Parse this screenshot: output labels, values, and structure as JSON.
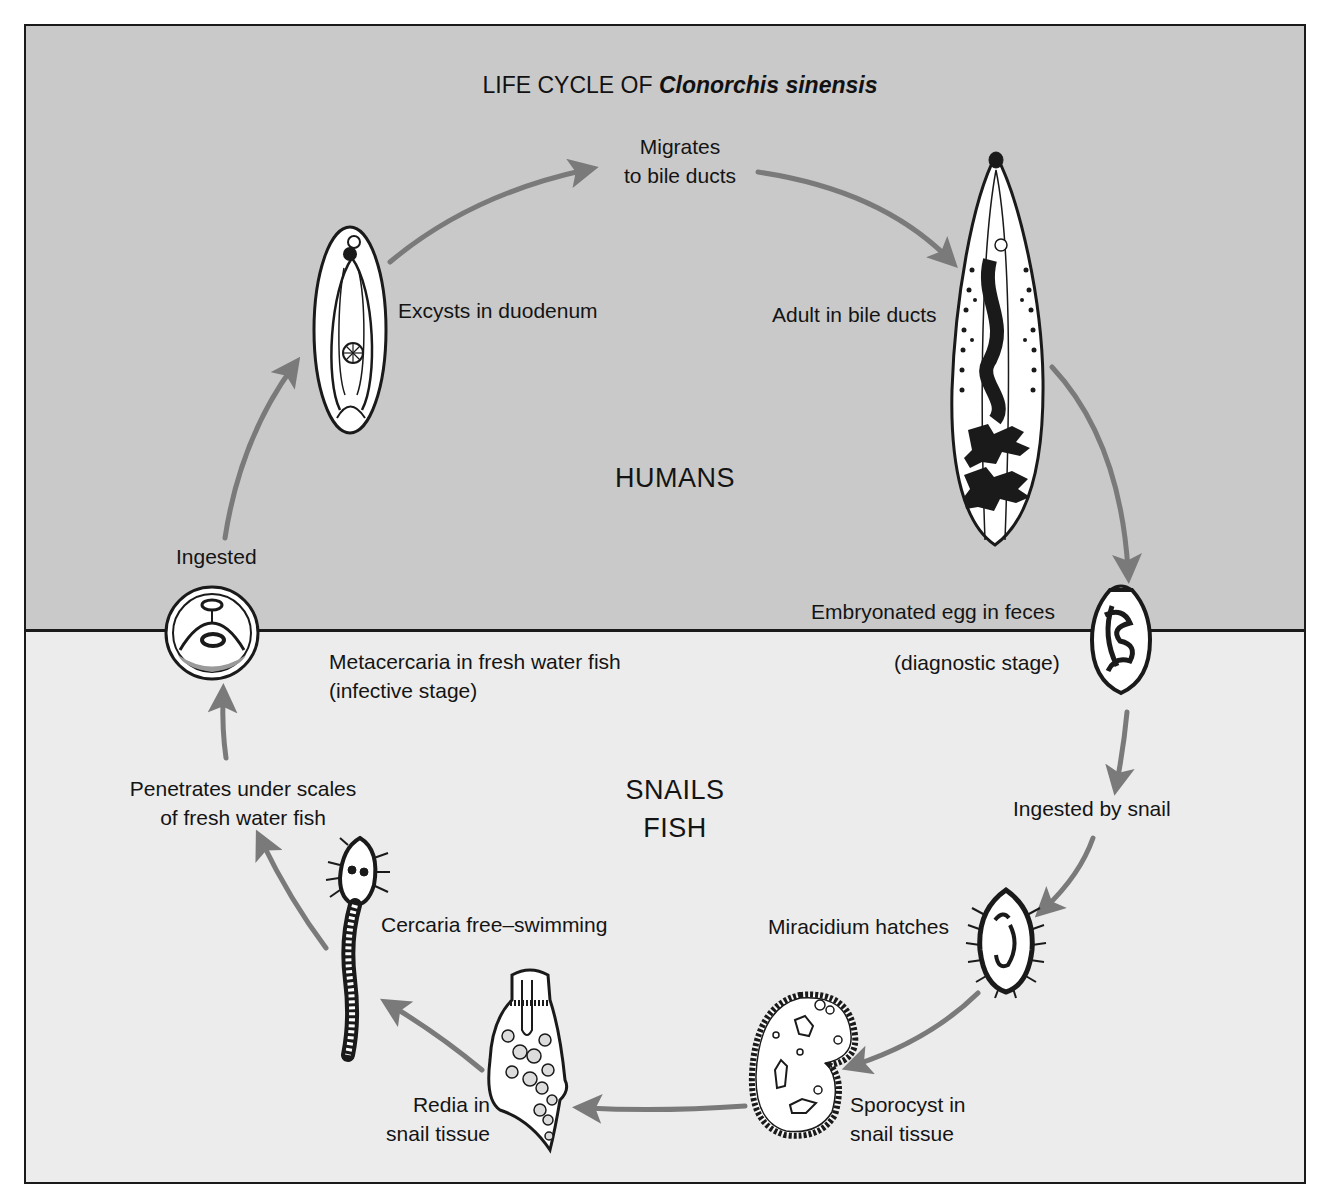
{
  "title": {
    "prefix": "LIFE CYCLE OF",
    "species": "Clonorchis sinensis"
  },
  "regions": {
    "top": {
      "label": "HUMANS",
      "color": "#c9c9c9"
    },
    "bottom": {
      "label_line1": "SNAILS",
      "label_line2": "FISH",
      "color": "#ececec"
    }
  },
  "colors": {
    "arrow": "#7a7a7a",
    "outline": "#1a1a1a",
    "organism_fill": "#ffffff"
  },
  "stages": [
    {
      "id": "adult",
      "label": "Adult in bile ducts"
    },
    {
      "id": "egg",
      "label_line1": "Embryonated egg in feces",
      "label_line2": "(diagnostic stage)"
    },
    {
      "id": "snail-ingestion",
      "label": "Ingested by snail"
    },
    {
      "id": "miracidium",
      "label": "Miracidium hatches"
    },
    {
      "id": "sporocyst",
      "label_line1": "Sporocyst in",
      "label_line2": "snail tissue"
    },
    {
      "id": "redia",
      "label_line1": "Redia in",
      "label_line2": "snail tissue"
    },
    {
      "id": "cercaria",
      "label": "Cercaria free–swimming"
    },
    {
      "id": "penetration",
      "label_line1": "Penetrates under scales",
      "label_line2": "of fresh water fish"
    },
    {
      "id": "metacercaria",
      "label_line1": "Metacercaria in fresh water fish",
      "label_line2": "(infective stage)"
    },
    {
      "id": "ingested",
      "label": "Ingested"
    },
    {
      "id": "excystation",
      "label": "Excysts in duodenum"
    },
    {
      "id": "migration",
      "label_line1": "Migrates",
      "label_line2": "to bile ducts"
    }
  ],
  "cycle_order": [
    "excystation",
    "migration",
    "adult",
    "egg",
    "snail-ingestion",
    "miracidium",
    "sporocyst",
    "redia",
    "cercaria",
    "penetration",
    "metacercaria",
    "ingested"
  ]
}
